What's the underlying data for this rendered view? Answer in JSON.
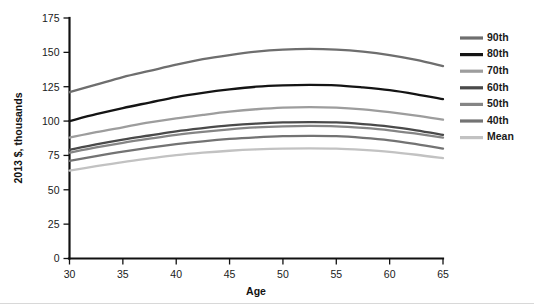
{
  "chart_data": {
    "type": "line",
    "title": "",
    "xlabel": "Age",
    "ylabel": "2013 $, thousands",
    "xlim": [
      30,
      65
    ],
    "ylim": [
      0,
      175
    ],
    "xticks": [
      30,
      35,
      40,
      45,
      50,
      55,
      60,
      65
    ],
    "yticks": [
      0,
      25,
      50,
      75,
      100,
      125,
      150,
      175
    ],
    "grid": false,
    "legend_position": "right",
    "x": [
      30,
      32.5,
      35,
      37.5,
      40,
      42.5,
      45,
      47.5,
      50,
      52.5,
      55,
      57.5,
      60,
      62.5,
      65
    ],
    "series": [
      {
        "name": "90th",
        "color": "#6e6e6e",
        "values": [
          121,
          126.5,
          132,
          136.5,
          141,
          145,
          148,
          150.5,
          152,
          152.5,
          152,
          150.5,
          148,
          144.5,
          140
        ]
      },
      {
        "name": "80th",
        "color": "#141414",
        "values": [
          100,
          105,
          109.5,
          113.5,
          117.5,
          120.5,
          123,
          125,
          126,
          126.3,
          126,
          124.5,
          122.5,
          119.5,
          116
        ]
      },
      {
        "name": "70th",
        "color": "#9d9d9d",
        "values": [
          88,
          92,
          95.5,
          99,
          102,
          104.5,
          106.8,
          108.6,
          109.8,
          110.2,
          109.8,
          108.5,
          106.5,
          104,
          101
        ]
      },
      {
        "name": "60th",
        "color": "#4a4a4a",
        "values": [
          79,
          83,
          86.5,
          89.5,
          92.5,
          94.8,
          96.8,
          98.2,
          99,
          99.2,
          99,
          97.8,
          96,
          93.3,
          90
        ]
      },
      {
        "name": "50th",
        "color": "#858585",
        "values": [
          77,
          80.8,
          84.2,
          87.2,
          90,
          92.2,
          94,
          95.4,
          96.2,
          96.5,
          96.2,
          95,
          93.3,
          90.8,
          88
        ]
      },
      {
        "name": "40th",
        "color": "#737373",
        "values": [
          71,
          74.5,
          77.8,
          80.7,
          83.2,
          85.3,
          87,
          88.2,
          89,
          89.2,
          89,
          87.8,
          86,
          83.2,
          80
        ]
      },
      {
        "name": "Mean",
        "color": "#c2c2c2",
        "values": [
          64,
          67.2,
          70.2,
          72.8,
          75.2,
          77,
          78.4,
          79.4,
          80,
          80.2,
          80,
          79,
          77.6,
          75.5,
          73
        ]
      }
    ]
  },
  "legend": {
    "items": [
      {
        "label": "90th",
        "color": "#6e6e6e"
      },
      {
        "label": "80th",
        "color": "#141414"
      },
      {
        "label": "70th",
        "color": "#9d9d9d"
      },
      {
        "label": "60th",
        "color": "#4a4a4a"
      },
      {
        "label": "50th",
        "color": "#858585"
      },
      {
        "label": "40th",
        "color": "#737373"
      },
      {
        "label": "Mean",
        "color": "#c2c2c2"
      }
    ]
  },
  "axes": {
    "x_title": "Age",
    "y_title": "2013 $, thousands",
    "x_tick_labels": [
      "30",
      "35",
      "40",
      "45",
      "50",
      "55",
      "60",
      "65"
    ],
    "y_tick_labels": [
      "0",
      "25",
      "50",
      "75",
      "100",
      "125",
      "150",
      "175"
    ]
  },
  "colors": {
    "axis": "#111111",
    "text": "#1a1a1a",
    "background": "#ffffff"
  }
}
